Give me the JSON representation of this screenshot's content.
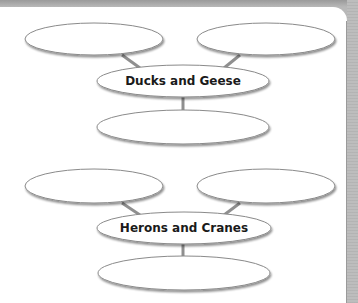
{
  "diagram": {
    "groups": [
      {
        "title": "Ducks and Geese",
        "top_left_text": "",
        "top_right_text": "",
        "bottom_text": ""
      },
      {
        "title": "Herons and Cranes",
        "top_left_text": "",
        "top_right_text": "",
        "bottom_text": ""
      }
    ],
    "colors": {
      "ellipse_stroke": "#8a8a8a",
      "ellipse_shadow": "#9a9a9a",
      "connector": "#8f8f8f",
      "frame": "#b8b8b8"
    }
  }
}
